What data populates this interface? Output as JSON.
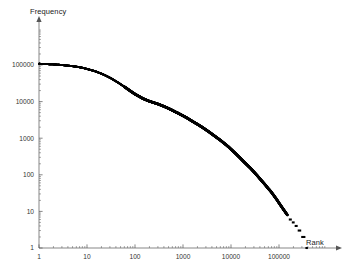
{
  "chart_data": {
    "type": "scatter",
    "title": "",
    "subtitle": "",
    "xlabel": "Rank",
    "ylabel": "Frequency",
    "xscale": "log",
    "yscale": "log",
    "grid": false,
    "legend": "none",
    "xlim": [
      1,
      400000
    ],
    "ylim": [
      1,
      200000
    ],
    "x_ticks": [
      1,
      10,
      100,
      1000,
      10000,
      100000
    ],
    "x_tick_labels": [
      "1",
      "10",
      "100",
      "1000",
      "10000",
      "100000"
    ],
    "y_ticks": [
      1,
      10,
      100,
      1000,
      10000,
      100000
    ],
    "y_tick_labels": [
      "1",
      "10",
      "100",
      "1000",
      "10000",
      "100000"
    ],
    "marker": "point",
    "marker_color": "#000000",
    "marker_size": 1.6,
    "axis_color": "#555555",
    "points": [
      [
        1,
        108000
      ],
      [
        2,
        104000
      ],
      [
        3,
        100000
      ],
      [
        4,
        96000
      ],
      [
        5,
        93000
      ],
      [
        6,
        90000
      ],
      [
        7,
        87000
      ],
      [
        8,
        84000
      ],
      [
        9,
        81000
      ],
      [
        10,
        78000
      ],
      [
        12,
        73000
      ],
      [
        14,
        69000
      ],
      [
        16,
        65000
      ],
      [
        18,
        61000
      ],
      [
        20,
        58000
      ],
      [
        24,
        52000
      ],
      [
        28,
        47000
      ],
      [
        32,
        43000
      ],
      [
        36,
        39000
      ],
      [
        40,
        36000
      ],
      [
        48,
        31000
      ],
      [
        56,
        27000
      ],
      [
        64,
        24000
      ],
      [
        72,
        21500
      ],
      [
        80,
        19500
      ],
      [
        100,
        16000
      ],
      [
        120,
        14000
      ],
      [
        140,
        12500
      ],
      [
        160,
        11500
      ],
      [
        180,
        10800
      ],
      [
        200,
        10200
      ],
      [
        250,
        9300
      ],
      [
        300,
        8600
      ],
      [
        400,
        7400
      ],
      [
        500,
        6500
      ],
      [
        600,
        5800
      ],
      [
        700,
        5200
      ],
      [
        800,
        4800
      ],
      [
        900,
        4400
      ],
      [
        1000,
        4100
      ],
      [
        1200,
        3600
      ],
      [
        1500,
        3000
      ],
      [
        1800,
        2600
      ],
      [
        2000,
        2400
      ],
      [
        2500,
        2000
      ],
      [
        3000,
        1700
      ],
      [
        3500,
        1480
      ],
      [
        4000,
        1300
      ],
      [
        5000,
        1050
      ],
      [
        6000,
        880
      ],
      [
        7000,
        750
      ],
      [
        8000,
        650
      ],
      [
        9000,
        570
      ],
      [
        10000,
        500
      ],
      [
        12000,
        400
      ],
      [
        15000,
        300
      ],
      [
        18000,
        235
      ],
      [
        20000,
        205
      ],
      [
        25000,
        155
      ],
      [
        30000,
        120
      ],
      [
        35000,
        96
      ],
      [
        40000,
        78
      ],
      [
        50000,
        56
      ],
      [
        60000,
        42
      ],
      [
        70000,
        33
      ],
      [
        80000,
        26
      ],
      [
        90000,
        21
      ],
      [
        100000,
        17
      ],
      [
        120000,
        12
      ],
      [
        140000,
        9
      ],
      [
        160000,
        7
      ],
      [
        180000,
        6
      ],
      [
        200000,
        5
      ],
      [
        230000,
        4
      ],
      [
        270000,
        3
      ],
      [
        310000,
        2
      ],
      [
        400000,
        1
      ]
    ],
    "tail_steps": [
      {
        "freq": 6,
        "rank_start": 160000,
        "rank_end": 185000
      },
      {
        "freq": 5,
        "rank_start": 185000,
        "rank_end": 212000
      },
      {
        "freq": 4,
        "rank_start": 212000,
        "rank_end": 245000
      },
      {
        "freq": 3,
        "rank_start": 245000,
        "rank_end": 290000
      },
      {
        "freq": 2,
        "rank_start": 290000,
        "rank_end": 355000
      },
      {
        "freq": 1,
        "rank_start": 355000,
        "rank_end": 400000
      }
    ]
  }
}
